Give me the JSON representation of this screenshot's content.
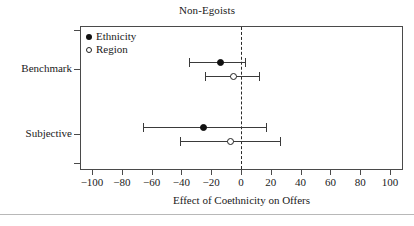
{
  "chart_data": {
    "type": "scatter",
    "title": "Non-Egoists",
    "xlabel": "Effect of Coethnicity on Offers",
    "ylabel": "",
    "xlim": [
      -110,
      110
    ],
    "xticks": [
      -100,
      -80,
      -60,
      -40,
      -20,
      0,
      20,
      40,
      60,
      80,
      100
    ],
    "xticklabels": [
      "−100",
      "−80",
      "−60",
      "−40",
      "−20",
      "0",
      "20",
      "40",
      "60",
      "80",
      "100"
    ],
    "yticklabels": [
      "Benchmark",
      "Subjective"
    ],
    "grid": false,
    "reference_line": 0,
    "reference_line_style": "dashed",
    "legend": {
      "position": "top-left-inside",
      "entries": [
        {
          "label": "Ethnicity",
          "marker": "filled-circle"
        },
        {
          "label": "Region",
          "marker": "hollow-circle"
        }
      ]
    },
    "groups": [
      {
        "group": "Benchmark",
        "series": [
          {
            "name": "Ethnicity",
            "marker": "filled-circle",
            "estimate": -14,
            "ci_low": -35,
            "ci_high": 3
          },
          {
            "name": "Region",
            "marker": "hollow-circle",
            "estimate": -5,
            "ci_low": -24,
            "ci_high": 12
          }
        ]
      },
      {
        "group": "Subjective",
        "series": [
          {
            "name": "Ethnicity",
            "marker": "filled-circle",
            "estimate": -25,
            "ci_low": -66,
            "ci_high": 17
          },
          {
            "name": "Region",
            "marker": "hollow-circle",
            "estimate": -7,
            "ci_low": -41,
            "ci_high": 26
          }
        ]
      }
    ]
  },
  "colors": {
    "axis": "#4a4a4a",
    "marker_filled": "#111111",
    "marker_hollow_edge": "#222222",
    "ci_line": "#3a3a3a",
    "text": "#1a1a1a",
    "background": "#ffffff"
  }
}
